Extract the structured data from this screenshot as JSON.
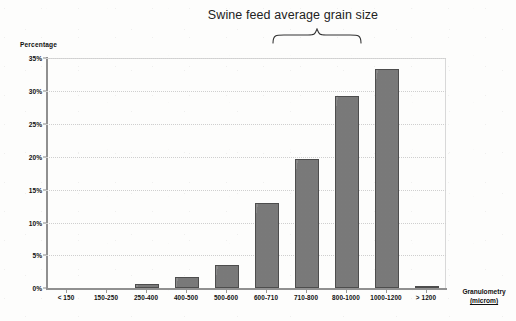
{
  "chart_data": {
    "type": "bar",
    "title": "Swine feed average grain size",
    "xlabel": "Granulometry",
    "xlabel_unit": "(microm)",
    "ylabel": "Percentage",
    "categories": [
      "< 150",
      "150-250",
      "250-400",
      "400-500",
      "500-600",
      "600-710",
      "710-800",
      "800-1000",
      "1000-1200",
      "> 1200"
    ],
    "values": [
      0,
      0,
      0.7,
      1.8,
      3.5,
      13.0,
      19.7,
      29.2,
      33.4,
      0.4
    ],
    "ylim": [
      0,
      35
    ],
    "ytick_labels": [
      "0%",
      "5%",
      "10%",
      "15%",
      "20%",
      "25%",
      "30%",
      "35%"
    ],
    "ytick_values": [
      0,
      5,
      10,
      15,
      20,
      25,
      30,
      35
    ],
    "grid": true,
    "grid_style": "dotted horizontal",
    "legend": "none",
    "annotations": [
      {
        "type": "brace",
        "text": "Swine feed average grain size",
        "spans_categories": [
          "710-800",
          "800-1000",
          "1000-1200"
        ]
      }
    ],
    "colors": {
      "bar_fill": "#7e7e7e",
      "bar_border": "#4d4d4d",
      "gridline": "#cfcfcf",
      "axis": "#909090",
      "text": "#111111",
      "background": "#fdfdfc"
    }
  }
}
